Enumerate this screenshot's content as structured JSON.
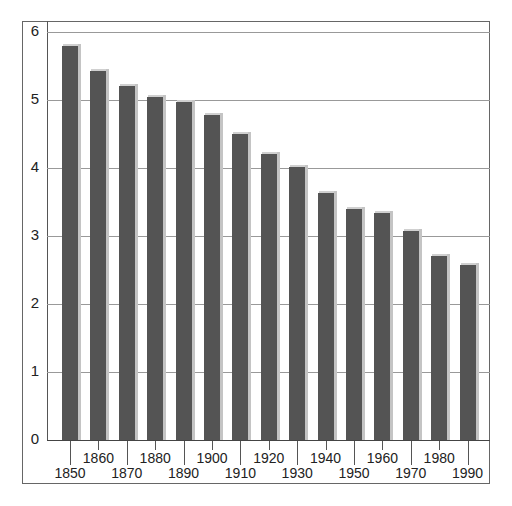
{
  "chart_data": {
    "type": "bar",
    "title": "",
    "xlabel": "",
    "ylabel": "",
    "ylim": [
      0,
      6
    ],
    "yticks": [
      0,
      1,
      2,
      3,
      4,
      5,
      6
    ],
    "grid": true,
    "legend": null,
    "categories": [
      "1850",
      "1860",
      "1870",
      "1880",
      "1890",
      "1900",
      "1910",
      "1920",
      "1930",
      "1940",
      "1950",
      "1960",
      "1970",
      "1980",
      "1990"
    ],
    "values": [
      5.8,
      5.43,
      5.21,
      5.04,
      4.97,
      4.78,
      4.5,
      4.21,
      4.02,
      3.63,
      3.4,
      3.34,
      3.07,
      2.71,
      2.57
    ],
    "colors": {
      "bar": "#545454",
      "bar_shadow": "#c4c4c4",
      "grid": "#999999",
      "frame": "#666666"
    }
  },
  "axis": {
    "y_labels": [
      "0",
      "1",
      "2",
      "3",
      "4",
      "5",
      "6"
    ],
    "x_labels": [
      "1850",
      "1860",
      "1870",
      "1880",
      "1890",
      "1900",
      "1910",
      "1920",
      "1930",
      "1940",
      "1950",
      "1960",
      "1970",
      "1980",
      "1990"
    ]
  }
}
